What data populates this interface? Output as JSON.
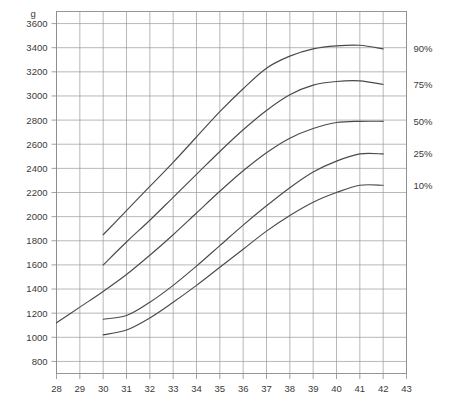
{
  "chart_data": {
    "type": "line",
    "title": "",
    "subtitle": "",
    "xlabel": "",
    "ylabel": "",
    "unit_label": "g",
    "xlim": [
      28,
      43
    ],
    "ylim": [
      700,
      3700
    ],
    "grid": true,
    "legend_position": "right",
    "x_ticks": [
      28,
      29,
      30,
      31,
      32,
      33,
      34,
      35,
      36,
      37,
      38,
      39,
      40,
      41,
      42,
      43
    ],
    "y_ticks": [
      800,
      1000,
      1200,
      1400,
      1600,
      1800,
      2000,
      2200,
      2400,
      2600,
      2800,
      3000,
      3200,
      3400,
      3600
    ],
    "y_tick_labels": [
      "800",
      "1000",
      "1200",
      "1400",
      "1600",
      "1800",
      "2000",
      "2200",
      "2400",
      "2600",
      "2800",
      "3000",
      "3200",
      "3400",
      "3600"
    ],
    "x_tick_labels": [
      "28",
      "29",
      "30",
      "31",
      "32",
      "33",
      "34",
      "35",
      "36",
      "37",
      "38",
      "39",
      "40",
      "41",
      "42",
      "43"
    ],
    "series": [
      {
        "name": "90%",
        "label": "90%",
        "color": "#4a4a4a",
        "x": [
          30,
          31,
          32,
          33,
          34,
          35,
          36,
          37,
          38,
          39,
          40,
          41,
          42
        ],
        "values": [
          1850,
          2050,
          2250,
          2450,
          2660,
          2870,
          3060,
          3230,
          3330,
          3390,
          3415,
          3420,
          3390
        ]
      },
      {
        "name": "75%",
        "label": "75%",
        "color": "#4a4a4a",
        "x": [
          30,
          31,
          32,
          33,
          34,
          35,
          36,
          37,
          38,
          39,
          40,
          41,
          42
        ],
        "values": [
          1600,
          1790,
          1970,
          2160,
          2350,
          2540,
          2720,
          2880,
          3010,
          3090,
          3120,
          3125,
          3095
        ]
      },
      {
        "name": "50%",
        "label": "50%",
        "color": "#4a4a4a",
        "x": [
          28,
          29,
          30,
          31,
          32,
          33,
          34,
          35,
          36,
          37,
          38,
          39,
          40,
          41,
          42
        ],
        "values": [
          1120,
          1250,
          1380,
          1520,
          1680,
          1850,
          2030,
          2210,
          2380,
          2530,
          2650,
          2730,
          2780,
          2790,
          2790
        ]
      },
      {
        "name": "25%",
        "label": "25%",
        "color": "#4a4a4a",
        "x": [
          30,
          31,
          32,
          33,
          34,
          35,
          36,
          37,
          38,
          39,
          40,
          41,
          42
        ],
        "values": [
          1150,
          1180,
          1290,
          1430,
          1590,
          1760,
          1930,
          2090,
          2240,
          2370,
          2460,
          2520,
          2520
        ]
      },
      {
        "name": "10%",
        "label": "10%",
        "color": "#4a4a4a",
        "x": [
          30,
          31,
          32,
          33,
          34,
          35,
          36,
          37,
          38,
          39,
          40,
          41,
          42
        ],
        "values": [
          1020,
          1060,
          1160,
          1290,
          1430,
          1580,
          1730,
          1880,
          2010,
          2120,
          2200,
          2260,
          2260
        ]
      }
    ]
  }
}
